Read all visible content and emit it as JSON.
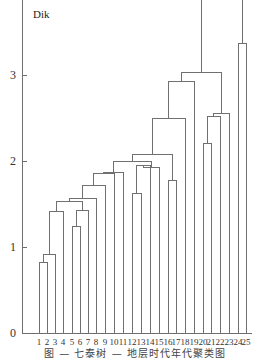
{
  "chart_data": {
    "type": "dendrogram",
    "title": "",
    "ylabel": "Dik",
    "xlabel": "",
    "ylim": [
      0,
      3.85
    ],
    "y_ticks": [
      0,
      1,
      2,
      3
    ],
    "grid": false,
    "leaves": [
      "1",
      "2",
      "3",
      "4",
      "5",
      "6",
      "7",
      "8",
      "9",
      "10",
      "11",
      "12",
      "13",
      "14",
      "15",
      "16",
      "17",
      "18",
      "19",
      "20",
      "21",
      "22",
      "23",
      "24",
      "25"
    ],
    "merges": [
      {
        "id": "c1",
        "left": "1",
        "right": "2",
        "height": 0.82
      },
      {
        "id": "c2",
        "left": "c1",
        "right": "3",
        "height": 0.91
      },
      {
        "id": "c3",
        "left": "c2",
        "right": "4",
        "height": 1.41
      },
      {
        "id": "c4",
        "left": "5",
        "right": "6",
        "height": 1.24
      },
      {
        "id": "c5",
        "left": "c4",
        "right": "7",
        "height": 1.43
      },
      {
        "id": "c6",
        "left": "c3",
        "right": "c5",
        "height": 1.53
      },
      {
        "id": "c7",
        "left": "c6",
        "right": "8",
        "height": 1.56
      },
      {
        "id": "c8",
        "left": "c7",
        "right": "9",
        "height": 1.72
      },
      {
        "id": "c9",
        "left": "c8",
        "right": "10",
        "height": 1.85
      },
      {
        "id": "c10",
        "left": "c9",
        "right": "11",
        "height": 1.87
      },
      {
        "id": "c11",
        "left": "12",
        "right": "13",
        "height": 1.62
      },
      {
        "id": "c12",
        "left": "c11",
        "right": "14",
        "height": 1.95
      },
      {
        "id": "c13",
        "left": "c12",
        "right": "15",
        "height": 1.93
      },
      {
        "id": "c14",
        "left": "c10",
        "right": "c13",
        "height": 2.0
      },
      {
        "id": "c15",
        "left": "16",
        "right": "17",
        "height": 1.77
      },
      {
        "id": "c16",
        "left": "c14",
        "right": "c15",
        "height": 2.08
      },
      {
        "id": "c17",
        "left": "c16",
        "right": "18",
        "height": 2.5
      },
      {
        "id": "c18",
        "left": "c17",
        "right": "19",
        "height": 2.93
      },
      {
        "id": "c19",
        "left": "20",
        "right": "21",
        "height": 2.2
      },
      {
        "id": "c20",
        "left": "c19",
        "right": "22",
        "height": 2.52
      },
      {
        "id": "c21",
        "left": "c20",
        "right": "23",
        "height": 2.55
      },
      {
        "id": "c22",
        "left": "c18",
        "right": "c21",
        "height": 3.03
      },
      {
        "id": "c23",
        "left": "24",
        "right": "25",
        "height": 3.37
      }
    ],
    "open_top": [
      "c22",
      "c23"
    ],
    "caption": "图 — 七泰树 — 地层时代年代聚类图"
  },
  "layout": {
    "axis_x": 22,
    "y0_px": 333,
    "px_per_unit": 86,
    "leaf_x": [
      39,
      47,
      55,
      63,
      72,
      80,
      88,
      96,
      105,
      114,
      123,
      132,
      141,
      150,
      159,
      168,
      176,
      185,
      194,
      203,
      211,
      220,
      229,
      238,
      246
    ],
    "axis_end_x": 252
  }
}
